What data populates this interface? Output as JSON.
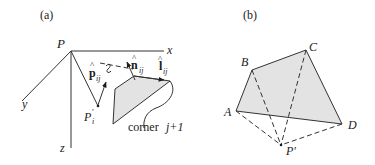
{
  "figure": {
    "panel_a": {
      "label": "(a)",
      "origin_label": "P",
      "axes": {
        "x": "x",
        "y": "y",
        "z": "z"
      },
      "point_label": "P",
      "point_prime": "′",
      "point_sub": "i",
      "vector_p": {
        "base": "p",
        "sub": "ij",
        "hat": "^"
      },
      "vector_n": {
        "base": "n",
        "sub": "ij",
        "hat": "^"
      },
      "vector_l": {
        "base": "l",
        "sub": "ij",
        "hat": "^"
      },
      "corner_text": "corner",
      "corner_index": "j+1"
    },
    "panel_b": {
      "label": "(b)",
      "vertices": [
        "A",
        "B",
        "C",
        "D"
      ],
      "point_label": "P′"
    },
    "colors": {
      "shade": "#e3e3e3",
      "stroke": "#333333",
      "text": "#1a1a1a"
    }
  }
}
